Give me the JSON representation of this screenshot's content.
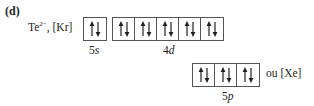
{
  "part_label": "(d)",
  "ion": {
    "symbol": "Te",
    "charge": "2−",
    "separator": ",",
    "core": "[Kr]"
  },
  "subshells": [
    {
      "n": "5",
      "l": "s",
      "orbitals": 1,
      "electrons_per_orbital": [
        2
      ]
    },
    {
      "n": "4",
      "l": "d",
      "orbitals": 5,
      "electrons_per_orbital": [
        2,
        2,
        2,
        2,
        2
      ]
    },
    {
      "n": "5",
      "l": "p",
      "orbitals": 3,
      "electrons_per_orbital": [
        2,
        2,
        2
      ]
    }
  ],
  "equivalent": {
    "word": "ou",
    "core": "[Xe]"
  }
}
